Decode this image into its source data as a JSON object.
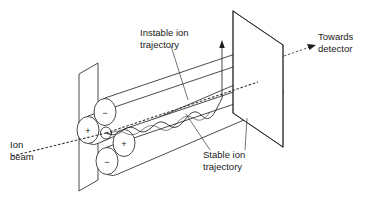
{
  "figure": {
    "background_color": "#ffffff",
    "line_color": "#1d1d1d",
    "text_color": "#1a1a1a",
    "width": 374,
    "height": 215
  },
  "labels": {
    "ion_beam": {
      "line1": "Ion",
      "line2": "beam",
      "x": 10,
      "y": 148
    },
    "instable_trajectory": {
      "line1": "Instable ion",
      "line2": "trajectory",
      "x": 140,
      "y": 36
    },
    "stable_trajectory": {
      "line1": "Stable ion",
      "line2": "trajectory",
      "x": 203,
      "y": 158
    },
    "towards_detector": {
      "line1": "Towards",
      "line2": "detector",
      "x": 318,
      "y": 50
    }
  },
  "electrodes": [
    {
      "name": "upper-left-rod",
      "polarity": "−",
      "cx": 105,
      "cy": 112,
      "rx": 11,
      "ry": 13.5
    },
    {
      "name": "lower-left-rod",
      "polarity": "+",
      "cx": 88,
      "cy": 130,
      "rx": 11,
      "ry": 13.5
    },
    {
      "name": "upper-right-rod",
      "polarity": "+",
      "cx": 124,
      "cy": 143,
      "rx": 11,
      "ry": 13.5
    },
    {
      "name": "lower-right-rod",
      "polarity": "−",
      "cx": 107,
      "cy": 161,
      "rx": 11,
      "ry": 13.5
    }
  ],
  "icons": {
    "escape_arrow": "up-arrow-icon",
    "detector_arrow": "right-arrow-icon",
    "beam_line": "dashed-beam-icon"
  },
  "geometry": {
    "near_plane": "79,74 98,64 98,180 79,190",
    "far_plane": "233,11 283,45 283,147 233,113",
    "axis_note": "perspective along +x toward detector"
  }
}
